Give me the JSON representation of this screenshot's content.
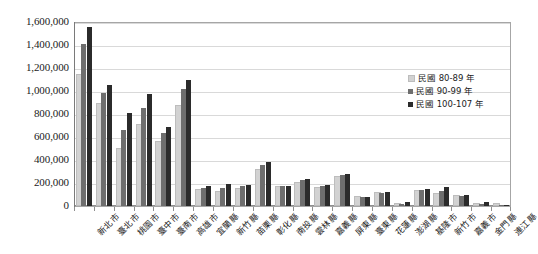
{
  "chart_data": {
    "type": "bar",
    "title": "",
    "xlabel": "",
    "ylabel": "",
    "ylim": [
      0,
      1600000
    ],
    "ytick_labels": [
      "1,600,000",
      "1,400,000",
      "1,200,000",
      "1,000,000",
      "800,000",
      "600,000",
      "400,000",
      "200,000",
      "0"
    ],
    "ytick_values": [
      1600000,
      1400000,
      1200000,
      1000000,
      800000,
      600000,
      400000,
      200000,
      0
    ],
    "grid": true,
    "legend_position": "right-inside",
    "categories": [
      "新北市",
      "臺北市",
      "桃園市",
      "臺中市",
      "臺南市",
      "高雄市",
      "宜蘭縣",
      "新竹縣",
      "苗栗縣",
      "彰化縣",
      "南投縣",
      "雲林縣",
      "嘉義縣",
      "屏東縣",
      "臺東縣",
      "花蓮縣",
      "澎湖縣",
      "基隆市",
      "新竹市",
      "嘉義市",
      "金門縣",
      "連江縣"
    ],
    "series": [
      {
        "name": "民國 80-89 年",
        "color": "#d2d2d2",
        "values": [
          1130000,
          880000,
          490000,
          695000,
          545000,
          865000,
          130000,
          110000,
          140000,
          305000,
          160000,
          195000,
          150000,
          245000,
          70000,
          105000,
          10000,
          125000,
          100000,
          75000,
          8000,
          1500
        ]
      },
      {
        "name": "民國 90-99 年",
        "color": "#6e6e6e",
        "values": [
          1410000,
          980000,
          665000,
          850000,
          635000,
          1020000,
          155000,
          160000,
          170000,
          360000,
          170000,
          225000,
          175000,
          270000,
          78000,
          115000,
          16000,
          140000,
          130000,
          88000,
          18000,
          2500
        ]
      },
      {
        "name": "民國 100-107 年",
        "color": "#2b2b2b",
        "values": [
          1560000,
          1055000,
          805000,
          970000,
          685000,
          1100000,
          170000,
          190000,
          185000,
          385000,
          178000,
          235000,
          182000,
          282000,
          82000,
          122000,
          32000,
          150000,
          162000,
          96000,
          33000,
          3000
        ]
      }
    ]
  },
  "legend": {
    "items": [
      {
        "label": "民國 80-89 年"
      },
      {
        "label": "民國 90-99 年"
      },
      {
        "label": "民國 100-107 年"
      }
    ]
  }
}
